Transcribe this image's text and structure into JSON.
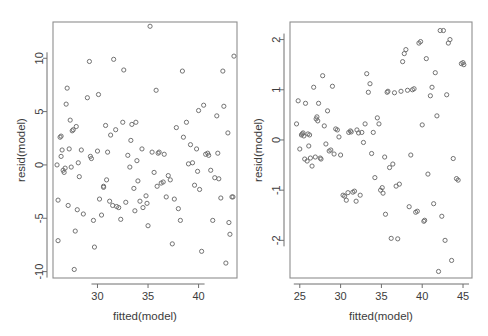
{
  "figure": {
    "type": "scatter-panel-pair",
    "background": "#ffffff",
    "marker": "open-circle",
    "marker_color": "#6c6c6c",
    "axis_color": "#8e8e8e"
  },
  "chart_data": [
    {
      "type": "scatter",
      "panel": "left",
      "title": "",
      "xlabel": "fitted(model)",
      "ylabel": "resid(model)",
      "xlim": [
        25.6,
        43.8
      ],
      "ylim": [
        -10.6,
        13.4
      ],
      "xticks": [
        30,
        35,
        40
      ],
      "yticks": [
        -10,
        -5,
        0,
        5,
        10
      ],
      "grid": false,
      "legend": "none",
      "n_points": 118,
      "points": [
        [
          26.0,
          0.0
        ],
        [
          26.1,
          -3.3
        ],
        [
          26.1,
          -7.1
        ],
        [
          26.3,
          2.6
        ],
        [
          26.4,
          2.7
        ],
        [
          26.5,
          1.4
        ],
        [
          26.4,
          0.8
        ],
        [
          26.6,
          -0.5
        ],
        [
          26.7,
          -0.7
        ],
        [
          26.8,
          -0.3
        ],
        [
          26.9,
          5.7
        ],
        [
          27.0,
          7.2
        ],
        [
          27.1,
          -3.8
        ],
        [
          27.3,
          4.2
        ],
        [
          27.4,
          -0.2
        ],
        [
          27.5,
          3.2
        ],
        [
          27.6,
          3.3
        ],
        [
          27.7,
          -9.8
        ],
        [
          27.8,
          -6.2
        ],
        [
          27.9,
          3.6
        ],
        [
          28.0,
          -4.2
        ],
        [
          28.2,
          -1.1
        ],
        [
          28.4,
          1.4
        ],
        [
          28.6,
          -4.6
        ],
        [
          29.0,
          6.3
        ],
        [
          29.2,
          9.7
        ],
        [
          29.4,
          0.6
        ],
        [
          29.3,
          0.8
        ],
        [
          29.6,
          -5.2
        ],
        [
          29.7,
          -7.7
        ],
        [
          30.0,
          1.3
        ],
        [
          30.1,
          6.6
        ],
        [
          30.2,
          -3.2
        ],
        [
          30.4,
          -4.7
        ],
        [
          30.6,
          -2.1
        ],
        [
          30.6,
          -2.0
        ],
        [
          30.8,
          3.7
        ],
        [
          31.0,
          1.2
        ],
        [
          31.2,
          -3.4
        ],
        [
          31.3,
          2.8
        ],
        [
          31.5,
          -3.8
        ],
        [
          31.6,
          9.9
        ],
        [
          31.8,
          3.3
        ],
        [
          31.9,
          -3.9
        ],
        [
          32.1,
          -4.0
        ],
        [
          32.3,
          -5.1
        ],
        [
          32.5,
          4.0
        ],
        [
          32.6,
          8.9
        ],
        [
          32.8,
          -3.5
        ],
        [
          33.0,
          0.9
        ],
        [
          33.2,
          -0.2
        ],
        [
          33.3,
          2.3
        ],
        [
          33.4,
          3.8
        ],
        [
          33.6,
          -2.2
        ],
        [
          33.7,
          -4.3
        ],
        [
          33.8,
          4.0
        ],
        [
          34.0,
          -1.5
        ],
        [
          34.2,
          -3.4
        ],
        [
          34.4,
          1.5
        ],
        [
          34.5,
          -4.0
        ],
        [
          34.8,
          -2.9
        ],
        [
          35.0,
          -5.7
        ],
        [
          35.2,
          13.0
        ],
        [
          35.4,
          1.2
        ],
        [
          35.6,
          -0.7
        ],
        [
          35.8,
          7.0
        ],
        [
          36.0,
          1.1
        ],
        [
          36.1,
          1.2
        ],
        [
          36.3,
          -1.7
        ],
        [
          36.5,
          -1.6
        ],
        [
          36.8,
          -3.0
        ],
        [
          37.0,
          -1.0
        ],
        [
          37.2,
          -1.4
        ],
        [
          37.4,
          -7.4
        ],
        [
          37.6,
          -3.2
        ],
        [
          37.8,
          3.5
        ],
        [
          38.0,
          -4.1
        ],
        [
          38.2,
          -5.2
        ],
        [
          38.4,
          8.8
        ],
        [
          38.5,
          2.6
        ],
        [
          38.8,
          4.0
        ],
        [
          39.0,
          0.1
        ],
        [
          39.2,
          1.9
        ],
        [
          39.4,
          0.2
        ],
        [
          39.6,
          -1.9
        ],
        [
          39.8,
          1.5
        ],
        [
          40.0,
          5.1
        ],
        [
          40.1,
          -2.3
        ],
        [
          40.3,
          -8.1
        ],
        [
          40.5,
          5.6
        ],
        [
          40.7,
          1.0
        ],
        [
          40.9,
          1.1
        ],
        [
          41.0,
          0.9
        ],
        [
          41.2,
          -0.5
        ],
        [
          41.4,
          -5.2
        ],
        [
          41.6,
          -1.2
        ],
        [
          41.8,
          4.6
        ],
        [
          42.0,
          -1.3
        ],
        [
          42.2,
          -3.1
        ],
        [
          42.4,
          8.8
        ],
        [
          42.5,
          5.5
        ],
        [
          42.7,
          -9.2
        ],
        [
          42.9,
          3.0
        ],
        [
          43.0,
          -5.4
        ],
        [
          43.1,
          -6.5
        ],
        [
          43.3,
          -3.0
        ],
        [
          43.4,
          -3.0
        ],
        [
          43.5,
          10.2
        ],
        [
          28.1,
          0.2
        ],
        [
          30.9,
          -1.4
        ],
        [
          33.9,
          0.4
        ],
        [
          36.6,
          1.0
        ],
        [
          39.9,
          -0.6
        ],
        [
          41.9,
          1.1
        ],
        [
          27.2,
          1.5
        ],
        [
          35.9,
          -2.0
        ],
        [
          34.9,
          -3.6
        ]
      ]
    },
    {
      "type": "scatter",
      "panel": "right",
      "title": "",
      "xlabel": "fitted(model)",
      "ylabel": "resid(model)",
      "xlim": [
        23.8,
        46.1
      ],
      "ylim": [
        -2.75,
        2.35
      ],
      "xticks": [
        25,
        30,
        35,
        40,
        45
      ],
      "yticks": [
        -2,
        -1,
        0,
        1,
        2
      ],
      "grid": false,
      "legend": "none",
      "n_points": 110,
      "points": [
        [
          24.6,
          0.32
        ],
        [
          24.8,
          0.78
        ],
        [
          25.0,
          -0.18
        ],
        [
          25.2,
          0.1
        ],
        [
          25.3,
          0.12
        ],
        [
          25.4,
          0.14
        ],
        [
          25.5,
          0.08
        ],
        [
          25.6,
          -0.38
        ],
        [
          25.7,
          0.73
        ],
        [
          25.9,
          -0.42
        ],
        [
          26.0,
          0.12
        ],
        [
          26.2,
          0.1
        ],
        [
          26.3,
          -0.36
        ],
        [
          26.5,
          -0.52
        ],
        [
          26.7,
          1.05
        ],
        [
          26.9,
          -0.34
        ],
        [
          27.0,
          0.42
        ],
        [
          27.1,
          0.46
        ],
        [
          27.2,
          0.38
        ],
        [
          27.3,
          0.73
        ],
        [
          27.5,
          -0.36
        ],
        [
          27.6,
          -0.38
        ],
        [
          27.8,
          1.28
        ],
        [
          28.0,
          0.28
        ],
        [
          28.2,
          -0.08
        ],
        [
          28.4,
          0.58
        ],
        [
          28.6,
          -0.22
        ],
        [
          28.8,
          -0.2
        ],
        [
          29.0,
          1.07
        ],
        [
          29.2,
          -0.28
        ],
        [
          29.4,
          0.22
        ],
        [
          29.6,
          0.2
        ],
        [
          29.8,
          0.06
        ],
        [
          30.0,
          -0.3
        ],
        [
          30.3,
          -1.1
        ],
        [
          30.5,
          -1.12
        ],
        [
          30.7,
          -1.2
        ],
        [
          30.9,
          -1.05
        ],
        [
          31.0,
          0.15
        ],
        [
          31.2,
          0.18
        ],
        [
          31.3,
          0.16
        ],
        [
          31.5,
          -1.04
        ],
        [
          31.7,
          -1.02
        ],
        [
          31.9,
          -1.22
        ],
        [
          32.0,
          0.2
        ],
        [
          32.2,
          0.14
        ],
        [
          32.4,
          -1.1
        ],
        [
          32.6,
          0.15
        ],
        [
          32.8,
          -0.05
        ],
        [
          33.0,
          0.32
        ],
        [
          33.2,
          1.32
        ],
        [
          33.4,
          0.95
        ],
        [
          33.6,
          1.12
        ],
        [
          33.8,
          -0.27
        ],
        [
          34.0,
          0.15
        ],
        [
          34.2,
          -0.75
        ],
        [
          34.5,
          0.44
        ],
        [
          34.7,
          0.32
        ],
        [
          34.9,
          -1.0
        ],
        [
          35.1,
          -0.95
        ],
        [
          35.2,
          -1.06
        ],
        [
          35.4,
          -0.34
        ],
        [
          35.5,
          -1.48
        ],
        [
          35.7,
          0.95
        ],
        [
          35.8,
          0.97
        ],
        [
          36.0,
          -0.55
        ],
        [
          36.2,
          -1.96
        ],
        [
          36.4,
          -0.48
        ],
        [
          36.6,
          0.94
        ],
        [
          36.8,
          -0.92
        ],
        [
          37.0,
          -1.97
        ],
        [
          37.2,
          -0.88
        ],
        [
          37.4,
          0.97
        ],
        [
          37.6,
          1.56
        ],
        [
          37.8,
          1.72
        ],
        [
          38.0,
          1.8
        ],
        [
          38.2,
          0.99
        ],
        [
          38.4,
          -1.33
        ],
        [
          38.6,
          -0.3
        ],
        [
          38.8,
          1.0
        ],
        [
          39.0,
          1.02
        ],
        [
          39.2,
          -1.44
        ],
        [
          39.4,
          -1.42
        ],
        [
          39.6,
          1.93
        ],
        [
          39.8,
          1.96
        ],
        [
          40.0,
          0.3
        ],
        [
          40.2,
          -1.62
        ],
        [
          40.3,
          -1.6
        ],
        [
          40.5,
          1.62
        ],
        [
          40.7,
          -0.68
        ],
        [
          41.0,
          0.88
        ],
        [
          41.2,
          1.05
        ],
        [
          41.4,
          -1.27
        ],
        [
          41.6,
          1.34
        ],
        [
          41.8,
          0.48
        ],
        [
          42.0,
          -2.62
        ],
        [
          42.2,
          2.18
        ],
        [
          42.4,
          -1.52
        ],
        [
          42.6,
          2.18
        ],
        [
          42.8,
          -2.0
        ],
        [
          43.0,
          0.9
        ],
        [
          43.2,
          1.93
        ],
        [
          43.4,
          2.0
        ],
        [
          43.6,
          -2.4
        ],
        [
          43.8,
          -0.37
        ],
        [
          44.2,
          -0.77
        ],
        [
          44.4,
          -0.8
        ],
        [
          44.8,
          1.52
        ],
        [
          45.0,
          1.54
        ],
        [
          45.1,
          1.5
        ],
        [
          26.1,
          -0.12
        ]
      ]
    }
  ]
}
